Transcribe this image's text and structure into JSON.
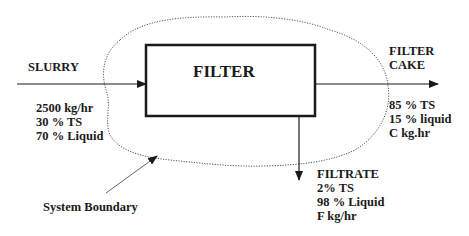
{
  "diagram": {
    "process_unit": {
      "label": "FILTER"
    },
    "streams": {
      "input": {
        "name": "SLURRY",
        "properties": [
          "2500 kg/hr",
          "30 % TS",
          "70 % Liquid"
        ]
      },
      "filter_cake": {
        "name_line1": "FILTER",
        "name_line2": "CAKE",
        "properties": [
          "85 % TS",
          "15 % liquid",
          "C kg.hr"
        ]
      },
      "filtrate": {
        "name": "FILTRATE",
        "properties": [
          "2% TS",
          "98 % Liquid",
          "F kg/hr"
        ]
      }
    },
    "boundary": {
      "label": "System Boundary"
    }
  },
  "colors": {
    "line": "#1a1a1a",
    "boundary": "#555555",
    "background": "#ffffff"
  }
}
